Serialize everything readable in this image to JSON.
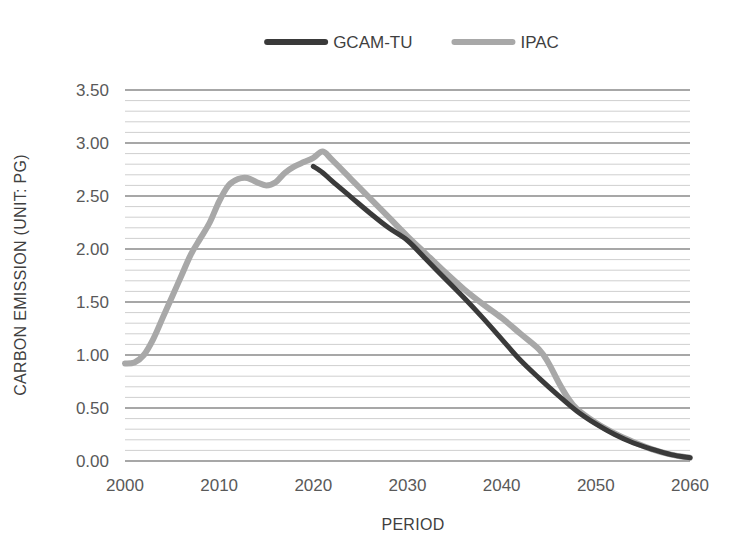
{
  "chart_data": {
    "type": "line",
    "title": "",
    "xlabel": "PERIOD",
    "ylabel": "CARBON EMISSION (UNIT: PG)",
    "xlim": [
      2000,
      2060
    ],
    "ylim": [
      0.0,
      3.5
    ],
    "xticks": [
      "2000",
      "2010",
      "2020",
      "2030",
      "2040",
      "2050",
      "2060"
    ],
    "xtick_values": [
      2000,
      2010,
      2020,
      2030,
      2040,
      2050,
      2060
    ],
    "yticks": [
      "0.00",
      "0.50",
      "1.00",
      "1.50",
      "2.00",
      "2.50",
      "3.00",
      "3.50"
    ],
    "ytick_values": [
      0.0,
      0.5,
      1.0,
      1.5,
      2.0,
      2.5,
      3.0,
      3.5
    ],
    "grid": true,
    "minor_grid": true,
    "minor_grid_step": 0.1,
    "legend_position": "top-center",
    "series": [
      {
        "name": "GCAM-TU",
        "color": "#3a3a3a",
        "width": 5,
        "x": [
          2020,
          2021,
          2022,
          2024,
          2026,
          2028,
          2030,
          2032,
          2034,
          2036,
          2038,
          2040,
          2042,
          2044,
          2046,
          2048,
          2050,
          2052,
          2054,
          2056,
          2058,
          2060
        ],
        "values": [
          2.78,
          2.72,
          2.64,
          2.49,
          2.34,
          2.2,
          2.08,
          1.9,
          1.72,
          1.54,
          1.35,
          1.15,
          0.95,
          0.78,
          0.62,
          0.47,
          0.35,
          0.25,
          0.17,
          0.11,
          0.06,
          0.03
        ]
      },
      {
        "name": "IPAC",
        "color": "#a8a8a8",
        "width": 6,
        "x": [
          2000,
          2001,
          2002,
          2003,
          2004,
          2005,
          2006,
          2007,
          2008,
          2009,
          2010,
          2011,
          2012,
          2013,
          2014,
          2015,
          2016,
          2017,
          2018,
          2019,
          2020,
          2021,
          2022,
          2024,
          2026,
          2028,
          2030,
          2032,
          2034,
          2036,
          2038,
          2040,
          2042,
          2044,
          2045,
          2046,
          2047,
          2048,
          2050,
          2052,
          2054,
          2056,
          2058,
          2060
        ],
        "values": [
          0.92,
          0.93,
          1.0,
          1.15,
          1.35,
          1.55,
          1.75,
          1.95,
          2.1,
          2.25,
          2.45,
          2.6,
          2.66,
          2.67,
          2.63,
          2.6,
          2.63,
          2.72,
          2.78,
          2.82,
          2.86,
          2.92,
          2.84,
          2.66,
          2.48,
          2.3,
          2.12,
          1.95,
          1.78,
          1.62,
          1.48,
          1.35,
          1.2,
          1.05,
          0.92,
          0.75,
          0.6,
          0.49,
          0.36,
          0.26,
          0.18,
          0.11,
          0.06,
          0.03
        ]
      }
    ]
  },
  "legend": {
    "items": [
      {
        "label": "GCAM-TU",
        "color": "#3a3a3a"
      },
      {
        "label": "IPAC",
        "color": "#a8a8a8"
      }
    ]
  },
  "axes": {
    "x_title": "PERIOD",
    "y_title": "CARBON EMISSION (UNIT: PG)"
  },
  "colors": {
    "gcam_tu": "#3a3a3a",
    "ipac": "#a8a8a8",
    "major_grid": "#8a8a8a",
    "minor_grid": "#cfcfcf",
    "text": "#3f3f3f",
    "background": "#ffffff"
  }
}
